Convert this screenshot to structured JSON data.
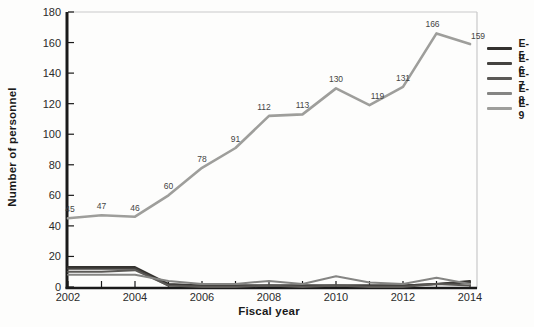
{
  "chart_data": {
    "type": "line",
    "title": "",
    "xlabel": "Fiscal year",
    "ylabel": "Number of personnel",
    "x": [
      2002,
      2003,
      2004,
      2005,
      2006,
      2007,
      2008,
      2009,
      2010,
      2011,
      2012,
      2013,
      2014
    ],
    "x_tick_labels": [
      "2002",
      "2004",
      "2006",
      "2008",
      "2010",
      "2012",
      "2014"
    ],
    "y_ticks": [
      0,
      20,
      40,
      60,
      80,
      100,
      120,
      140,
      160,
      180
    ],
    "ylim": [
      0,
      180
    ],
    "grid": false,
    "legend_position": "right",
    "series": [
      {
        "name": "E-5",
        "color": "#33312e",
        "values": [
          13,
          13,
          13,
          2,
          1,
          1,
          1,
          1,
          1,
          1,
          1,
          2,
          4
        ],
        "show_labels": false
      },
      {
        "name": "E-6",
        "color": "#454340",
        "values": [
          12,
          12,
          12,
          1,
          1,
          1,
          1,
          1,
          1,
          1,
          1,
          2,
          3
        ],
        "show_labels": false
      },
      {
        "name": "E-7",
        "color": "#5b5956",
        "values": [
          10,
          10,
          11,
          1,
          0,
          0,
          1,
          0,
          1,
          0,
          0,
          2,
          1
        ],
        "show_labels": false
      },
      {
        "name": "E-8",
        "color": "#858583",
        "values": [
          8,
          8,
          8,
          4,
          2,
          2,
          4,
          2,
          7,
          3,
          2,
          6,
          2
        ],
        "show_labels": false
      },
      {
        "name": "E-9",
        "color": "#9e9e9b",
        "values": [
          45,
          47,
          46,
          60,
          78,
          91,
          112,
          113,
          130,
          119,
          131,
          166,
          159
        ],
        "show_labels": true
      }
    ],
    "colors": {
      "axis": "#1a1a1a",
      "plot_border": "#c9c9c9",
      "tick_label": "#2b2b2b",
      "data_label": "#454545"
    }
  }
}
